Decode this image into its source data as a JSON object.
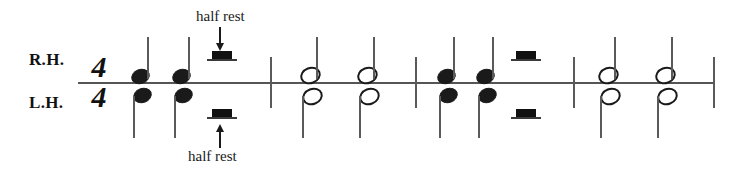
{
  "sheet": {
    "title": "Rhythm reading exercise: quarter notes, half notes and half rests",
    "staff_type": "single-line-rhythm-staff",
    "ink_color": "#1a1a1a",
    "line_color": "#555555",
    "background_color": "#ffffff"
  },
  "labels": {
    "right_hand": "R.H.",
    "left_hand": "L.H."
  },
  "time_signature": {
    "numerator": "4",
    "denominator": "4",
    "text": "4/4"
  },
  "annotations": [
    {
      "id": "half-rest-top",
      "text": "half rest",
      "arrow": "down",
      "points_to": "measure-1 right-hand half rest"
    },
    {
      "id": "half-rest-bottom",
      "text": "half rest",
      "arrow": "up",
      "points_to": "measure-1 left-hand half rest"
    }
  ],
  "measures": [
    {
      "number": 1,
      "right_hand": [
        {
          "type": "quarter-note",
          "stem": "up"
        },
        {
          "type": "quarter-note",
          "stem": "up"
        },
        {
          "type": "half-rest"
        }
      ],
      "left_hand": [
        {
          "type": "quarter-note",
          "stem": "down"
        },
        {
          "type": "quarter-note",
          "stem": "down"
        },
        {
          "type": "half-rest"
        }
      ]
    },
    {
      "number": 2,
      "right_hand": [
        {
          "type": "half-note",
          "stem": "up"
        },
        {
          "type": "half-note",
          "stem": "up"
        }
      ],
      "left_hand": [
        {
          "type": "half-note",
          "stem": "down"
        },
        {
          "type": "half-note",
          "stem": "down"
        }
      ]
    },
    {
      "number": 3,
      "right_hand": [
        {
          "type": "quarter-note",
          "stem": "up"
        },
        {
          "type": "quarter-note",
          "stem": "up"
        },
        {
          "type": "half-rest"
        }
      ],
      "left_hand": [
        {
          "type": "quarter-note",
          "stem": "down"
        },
        {
          "type": "quarter-note",
          "stem": "down"
        },
        {
          "type": "half-rest"
        }
      ]
    },
    {
      "number": 4,
      "right_hand": [
        {
          "type": "half-note",
          "stem": "up"
        },
        {
          "type": "half-note",
          "stem": "up"
        }
      ],
      "left_hand": [
        {
          "type": "half-note",
          "stem": "down"
        },
        {
          "type": "half-note",
          "stem": "down"
        }
      ]
    }
  ]
}
